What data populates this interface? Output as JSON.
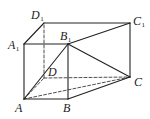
{
  "figure": {
    "type": "prism",
    "stroke_color": "#222222",
    "vertices": {
      "A": {
        "x": 24,
        "y": 99,
        "label": "A",
        "sub": "",
        "lx": 15,
        "ly": 112
      },
      "B": {
        "x": 68,
        "y": 99,
        "label": "B",
        "sub": "",
        "lx": 63,
        "ly": 112
      },
      "C": {
        "x": 130,
        "y": 77,
        "label": "C",
        "sub": "",
        "lx": 134,
        "ly": 86
      },
      "D": {
        "x": 44,
        "y": 78,
        "label": "D",
        "sub": "",
        "lx": 48,
        "ly": 76
      },
      "A1": {
        "x": 24,
        "y": 44,
        "label": "A",
        "sub": "1",
        "lx": 8,
        "ly": 49
      },
      "B1": {
        "x": 68,
        "y": 44,
        "label": "B",
        "sub": "1",
        "lx": 60,
        "ly": 40
      },
      "C1": {
        "x": 130,
        "y": 23,
        "label": "C",
        "sub": "1",
        "lx": 133,
        "ly": 25
      },
      "D1": {
        "x": 44,
        "y": 23,
        "label": "D",
        "sub": "1",
        "lx": 31,
        "ly": 19
      }
    },
    "solid_edges": [
      [
        "A",
        "B"
      ],
      [
        "B",
        "C"
      ],
      [
        "C",
        "C1"
      ],
      [
        "C1",
        "D1"
      ],
      [
        "D1",
        "A1"
      ],
      [
        "A1",
        "A"
      ],
      [
        "A1",
        "B1"
      ],
      [
        "B1",
        "B"
      ],
      [
        "B1",
        "C1"
      ],
      [
        "A",
        "B1"
      ],
      [
        "B1",
        "C"
      ]
    ],
    "dashed_edges": [
      [
        "A",
        "D"
      ],
      [
        "D",
        "C"
      ],
      [
        "D",
        "D1"
      ],
      [
        "A",
        "C"
      ]
    ]
  }
}
